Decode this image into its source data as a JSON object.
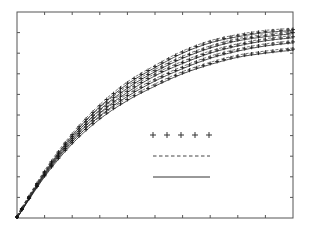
{
  "chart_data": {
    "type": "line",
    "title": "",
    "xlabel": "",
    "ylabel": "",
    "xlim": [
      0,
      10
    ],
    "ylim": [
      0,
      10
    ],
    "grid": false,
    "x_ticks_count": 10,
    "y_ticks_count": 10,
    "x": [
      0,
      1,
      2,
      3,
      4,
      5,
      6,
      7,
      8,
      9,
      10
    ],
    "series": [
      {
        "name": "curve-1",
        "values": [
          0,
          2.2,
          4.0,
          5.4,
          6.5,
          7.3,
          8.0,
          8.5,
          8.8,
          9.0,
          9.1
        ]
      },
      {
        "name": "curve-2",
        "values": [
          0,
          2.15,
          3.9,
          5.25,
          6.3,
          7.1,
          7.75,
          8.25,
          8.6,
          8.8,
          8.95
        ]
      },
      {
        "name": "curve-3",
        "values": [
          0,
          2.1,
          3.8,
          5.1,
          6.1,
          6.9,
          7.5,
          8.0,
          8.35,
          8.6,
          8.75
        ]
      },
      {
        "name": "curve-4",
        "values": [
          0,
          2.05,
          3.7,
          4.95,
          5.9,
          6.65,
          7.25,
          7.75,
          8.1,
          8.35,
          8.5
        ]
      },
      {
        "name": "curve-5",
        "values": [
          0,
          2.0,
          3.6,
          4.8,
          5.7,
          6.4,
          7.0,
          7.45,
          7.8,
          8.0,
          8.15
        ]
      }
    ],
    "legend": {
      "position": "center-right",
      "entries": [
        {
          "style": "plus-markers",
          "label": ""
        },
        {
          "style": "dashed",
          "label": ""
        },
        {
          "style": "solid",
          "label": ""
        }
      ]
    }
  }
}
